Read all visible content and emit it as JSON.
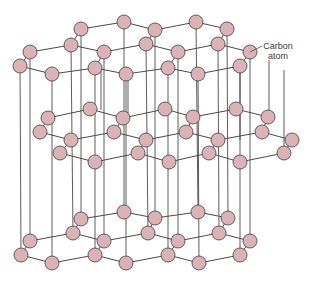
{
  "diagram": {
    "label": {
      "line1": "Carbon",
      "line2": "atom"
    },
    "colors": {
      "atom_fill": "#d9b3b5",
      "atom_stroke": "#5a4a4a",
      "bond": "#4a4a4a",
      "label": "#3a3a3a"
    },
    "atom_radius": 7,
    "layers": [
      {
        "name": "top",
        "atoms": [
          [
            81,
            29
          ],
          [
            124,
            22
          ],
          [
            155,
            30
          ],
          [
            196,
            22
          ],
          [
            227,
            29
          ],
          [
            71,
            45
          ],
          [
            146,
            44
          ],
          [
            218,
            44
          ],
          [
            30,
            52
          ],
          [
            104,
            52
          ],
          [
            178,
            52
          ],
          [
            250,
            52
          ],
          [
            20,
            66
          ],
          [
            52,
            74
          ],
          [
            95,
            68
          ],
          [
            126,
            74
          ],
          [
            168,
            68
          ],
          [
            198,
            74
          ],
          [
            240,
            66
          ]
        ],
        "bonds": [
          [
            0,
            1
          ],
          [
            1,
            2
          ],
          [
            2,
            3
          ],
          [
            3,
            4
          ],
          [
            0,
            5
          ],
          [
            2,
            6
          ],
          [
            4,
            7
          ],
          [
            5,
            8
          ],
          [
            5,
            9
          ],
          [
            6,
            9
          ],
          [
            6,
            10
          ],
          [
            7,
            10
          ],
          [
            7,
            11
          ],
          [
            8,
            12
          ],
          [
            12,
            13
          ],
          [
            13,
            14
          ],
          [
            14,
            9
          ],
          [
            14,
            15
          ],
          [
            15,
            16
          ],
          [
            16,
            10
          ],
          [
            16,
            17
          ],
          [
            17,
            18
          ],
          [
            18,
            11
          ]
        ]
      },
      {
        "name": "middle",
        "atoms": [
          [
            48,
            118
          ],
          [
            90,
            109
          ],
          [
            123,
            118
          ],
          [
            40,
            132
          ],
          [
            71,
            140
          ],
          [
            114,
            132
          ],
          [
            146,
            140
          ],
          [
            60,
            153
          ],
          [
            95,
            162
          ],
          [
            138,
            153
          ],
          [
            165,
            109
          ],
          [
            193,
            117
          ],
          [
            236,
            109
          ],
          [
            268,
            117
          ],
          [
            186,
            132
          ],
          [
            218,
            140
          ],
          [
            262,
            132
          ],
          [
            292,
            140
          ],
          [
            169,
            162
          ],
          [
            209,
            153
          ],
          [
            240,
            162
          ],
          [
            284,
            153
          ]
        ],
        "bonds": [
          [
            0,
            1
          ],
          [
            1,
            2
          ],
          [
            0,
            3
          ],
          [
            3,
            4
          ],
          [
            4,
            5
          ],
          [
            2,
            5
          ],
          [
            5,
            6
          ],
          [
            4,
            7
          ],
          [
            7,
            8
          ],
          [
            8,
            9
          ],
          [
            9,
            6
          ],
          [
            2,
            10
          ],
          [
            10,
            11
          ],
          [
            11,
            12
          ],
          [
            12,
            13
          ],
          [
            11,
            14
          ],
          [
            6,
            14
          ],
          [
            14,
            15
          ],
          [
            15,
            16
          ],
          [
            13,
            16
          ],
          [
            16,
            17
          ],
          [
            9,
            18
          ],
          [
            18,
            19
          ],
          [
            19,
            15
          ],
          [
            19,
            20
          ],
          [
            20,
            21
          ],
          [
            21,
            17
          ]
        ]
      },
      {
        "name": "bottom",
        "atoms": [
          [
            81,
            219
          ],
          [
            124,
            212
          ],
          [
            155,
            218
          ],
          [
            30,
            241
          ],
          [
            73,
            233
          ],
          [
            104,
            241
          ],
          [
            148,
            233
          ],
          [
            21,
            255
          ],
          [
            52,
            263
          ],
          [
            95,
            255
          ],
          [
            126,
            263
          ],
          [
            198,
            212
          ],
          [
            228,
            218
          ],
          [
            178,
            241
          ],
          [
            219,
            233
          ],
          [
            250,
            241
          ],
          [
            168,
            255
          ],
          [
            199,
            263
          ],
          [
            240,
            255
          ]
        ],
        "bonds": [
          [
            0,
            1
          ],
          [
            1,
            2
          ],
          [
            0,
            4
          ],
          [
            3,
            4
          ],
          [
            4,
            5
          ],
          [
            2,
            6
          ],
          [
            5,
            6
          ],
          [
            3,
            7
          ],
          [
            7,
            8
          ],
          [
            8,
            9
          ],
          [
            9,
            5
          ],
          [
            9,
            10
          ],
          [
            10,
            16
          ],
          [
            2,
            11
          ],
          [
            11,
            12
          ],
          [
            12,
            14
          ],
          [
            6,
            13
          ],
          [
            13,
            14
          ],
          [
            14,
            15
          ],
          [
            13,
            16
          ],
          [
            16,
            17
          ],
          [
            17,
            18
          ],
          [
            18,
            15
          ]
        ]
      }
    ],
    "verticals": [
      [
        20,
        66,
        21,
        255
      ],
      [
        30,
        52,
        30,
        241
      ],
      [
        52,
        74,
        52,
        263
      ],
      [
        71,
        45,
        73,
        233
      ],
      [
        81,
        29,
        81,
        219
      ],
      [
        95,
        68,
        95,
        255
      ],
      [
        104,
        52,
        104,
        241
      ],
      [
        124,
        22,
        124,
        212
      ],
      [
        126,
        74,
        126,
        263
      ],
      [
        146,
        44,
        148,
        233
      ],
      [
        155,
        30,
        155,
        218
      ],
      [
        168,
        68,
        168,
        255
      ],
      [
        178,
        52,
        178,
        241
      ],
      [
        196,
        22,
        198,
        212
      ],
      [
        198,
        74,
        199,
        263
      ],
      [
        218,
        44,
        219,
        233
      ],
      [
        227,
        29,
        228,
        218
      ],
      [
        240,
        66,
        240,
        255
      ],
      [
        250,
        52,
        250,
        241
      ],
      [
        48,
        118,
        48,
        118
      ],
      [
        101,
        70,
        101,
        110
      ],
      [
        128,
        78,
        128,
        118
      ],
      [
        240,
        70,
        240,
        140
      ],
      [
        269,
        60,
        269,
        118
      ],
      [
        284,
        70,
        284,
        153
      ]
    ]
  }
}
